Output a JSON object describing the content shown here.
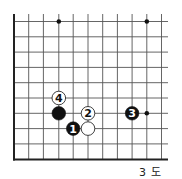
{
  "diagram": {
    "type": "go-board-partial",
    "caption": "3 도",
    "colors": {
      "line": "#555555",
      "edge": "#222222",
      "black": "#111111",
      "white": "#ffffff",
      "background": "#ffffff"
    },
    "grid": {
      "x_lines": [
        14,
        28.7,
        43.4,
        58.8,
        73.2,
        88,
        102.7,
        117.4,
        132.1,
        146.8,
        161.5
      ],
      "y_lines": [
        21.5,
        36.8,
        52.1,
        67.4,
        82.7,
        98,
        113.3,
        128.6,
        143.9,
        159.5
      ],
      "x_extent_right": 168,
      "y_extent_top": 14,
      "edges": [
        "left",
        "bottom"
      ]
    },
    "star_points": [
      {
        "col": 3,
        "row": 0
      },
      {
        "col": 9,
        "row": 0
      },
      {
        "col": 9,
        "row": 6
      }
    ],
    "stones": [
      {
        "color": "black",
        "col": 3,
        "row": 6,
        "label": ""
      },
      {
        "color": "white",
        "col": 3,
        "row": 5,
        "label": "4"
      },
      {
        "color": "white",
        "col": 5,
        "row": 6,
        "label": "2"
      },
      {
        "color": "black",
        "col": 4,
        "row": 7,
        "label": "1"
      },
      {
        "color": "white",
        "col": 5,
        "row": 7,
        "label": ""
      },
      {
        "color": "black",
        "col": 8,
        "row": 6,
        "label": "3"
      }
    ]
  }
}
